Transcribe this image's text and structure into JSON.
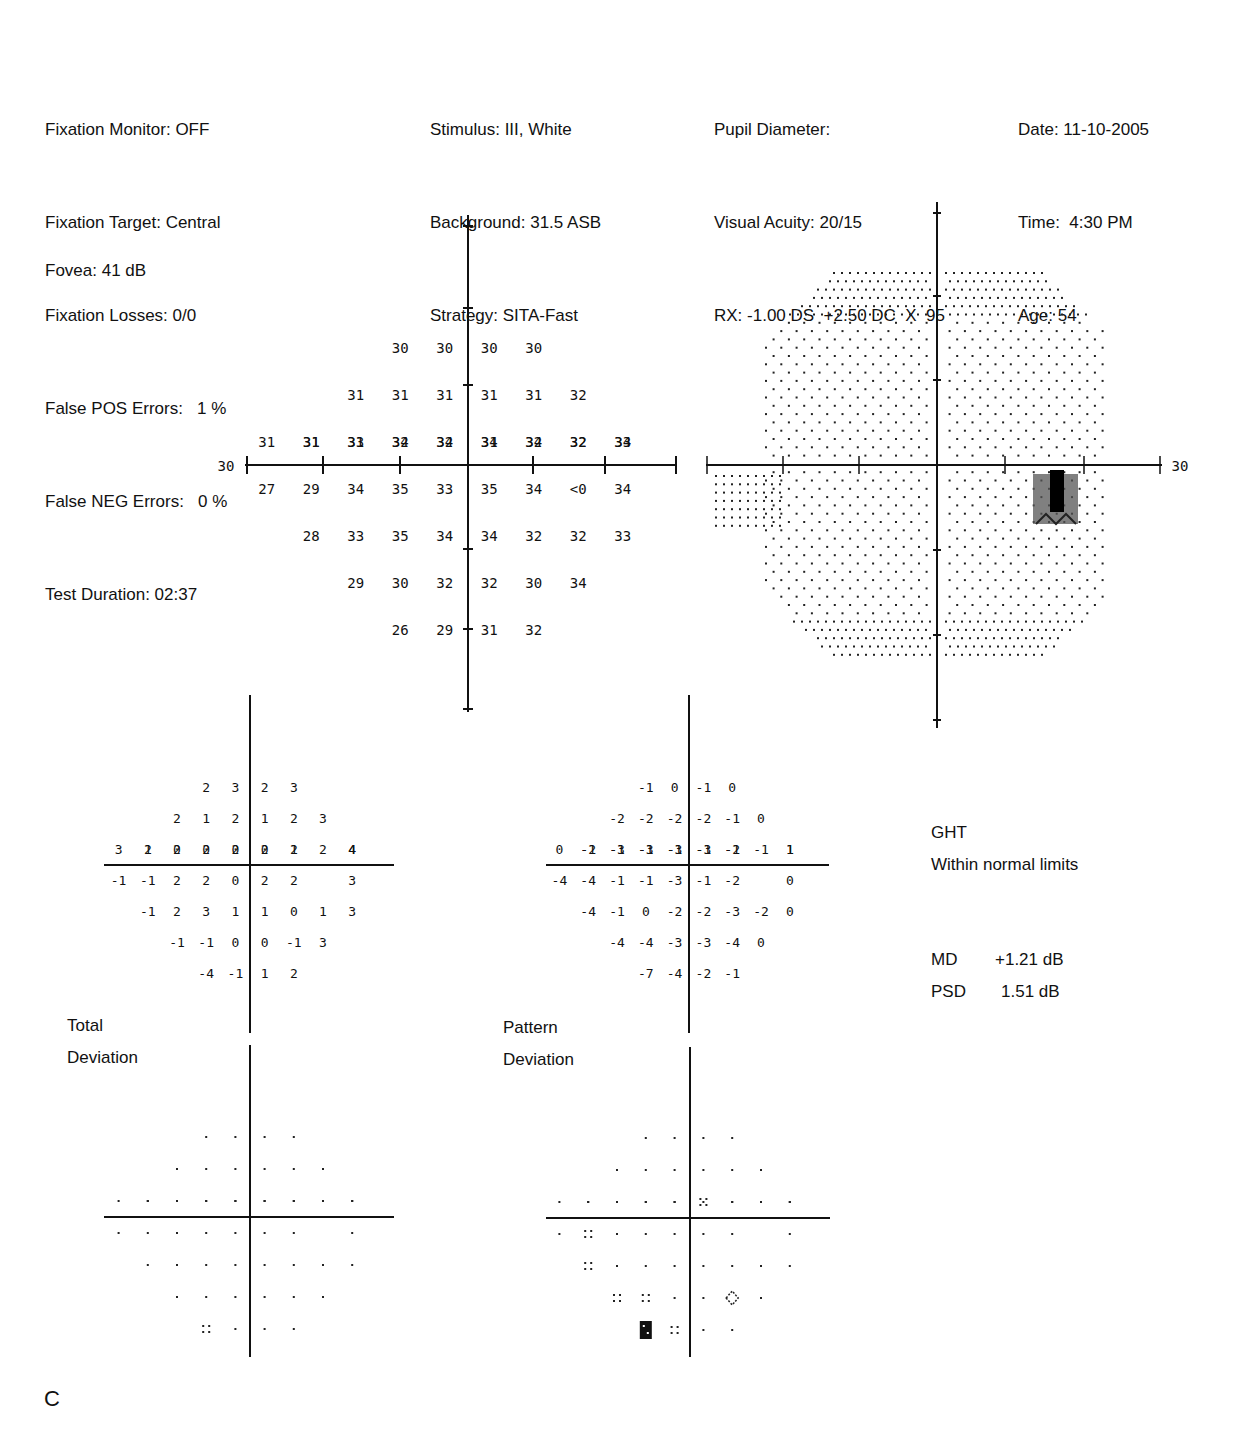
{
  "header": {
    "left": [
      "Fixation Monitor: OFF",
      "Fixation Target: Central",
      "Fixation Losses: 0/0",
      "False POS Errors:   1 %",
      "False NEG Errors:   0 %",
      "Test Duration: 02:37"
    ],
    "fovea": "Fovea: 41 dB",
    "stimulus": [
      "Stimulus: III, White",
      "Background: 31.5 ASB",
      "Strategy: SITA-Fast"
    ],
    "patient": [
      "Pupil Diameter:",
      "Visual Acuity: 20/15",
      "RX: -1.00 DS  +2.50 DC  X  95"
    ],
    "session": [
      "Date: 11-10-2005",
      "Time:  4:30 PM",
      "Age: 54"
    ]
  },
  "threshold_plot": {
    "axis_label_left": "30",
    "axis_label_right": "30",
    "rows": [
      {
        "y": 3,
        "cells": [
          [
            -2,
            "30"
          ],
          [
            -1,
            "30"
          ],
          [
            1,
            "30"
          ],
          [
            2,
            "30"
          ]
        ]
      },
      {
        "y": 2,
        "cells": [
          [
            -3,
            "31"
          ],
          [
            -2,
            "31"
          ],
          [
            -1,
            "31"
          ],
          [
            1,
            "31"
          ],
          [
            2,
            "31"
          ],
          [
            3,
            "32"
          ]
        ]
      },
      {
        "y": 1,
        "cells": [
          [
            -4,
            "31"
          ],
          [
            -3,
            "31"
          ],
          [
            -2,
            "32"
          ],
          [
            -1,
            "32"
          ],
          [
            1,
            "31"
          ],
          [
            2,
            "32"
          ],
          [
            3,
            "32"
          ],
          [
            4,
            "33"
          ]
        ]
      },
      {
        "y": 0,
        "cells": [
          [
            -5,
            "31"
          ],
          [
            -4,
            "31"
          ],
          [
            -3,
            "33"
          ],
          [
            -2,
            "34"
          ],
          [
            -1,
            "34"
          ],
          [
            1,
            "34"
          ],
          [
            2,
            "34"
          ],
          [
            3,
            "32"
          ],
          [
            4,
            "34"
          ]
        ]
      },
      {
        "y": -1,
        "cells": [
          [
            -5,
            "27"
          ],
          [
            -4,
            "29"
          ],
          [
            -3,
            "34"
          ],
          [
            -2,
            "35"
          ],
          [
            -1,
            "33"
          ],
          [
            1,
            "35"
          ],
          [
            2,
            "34"
          ],
          [
            3,
            "<0"
          ],
          [
            4,
            "34"
          ]
        ]
      },
      {
        "y": -2,
        "cells": [
          [
            -4,
            "28"
          ],
          [
            -3,
            "33"
          ],
          [
            -2,
            "35"
          ],
          [
            -1,
            "34"
          ],
          [
            1,
            "34"
          ],
          [
            2,
            "32"
          ],
          [
            3,
            "32"
          ],
          [
            4,
            "33"
          ]
        ]
      },
      {
        "y": -3,
        "cells": [
          [
            -3,
            "29"
          ],
          [
            -2,
            "30"
          ],
          [
            -1,
            "32"
          ],
          [
            1,
            "32"
          ],
          [
            2,
            "30"
          ],
          [
            3,
            "34"
          ]
        ]
      },
      {
        "y": -4,
        "cells": [
          [
            -2,
            "26"
          ],
          [
            -1,
            "29"
          ],
          [
            1,
            "31"
          ],
          [
            2,
            "32"
          ]
        ]
      }
    ]
  },
  "grayscale_plot": {
    "axis_label_right": "30",
    "blind_spot_note": "dark region inferotemporal (right of center, just below horizontal meridian)"
  },
  "total_deviation": {
    "label_line1": "Total",
    "label_line2": "Deviation",
    "rows": [
      {
        "y": 3,
        "cells": [
          [
            -2,
            "2"
          ],
          [
            -1,
            "3"
          ],
          [
            1,
            "2"
          ],
          [
            2,
            "3"
          ]
        ]
      },
      {
        "y": 2,
        "cells": [
          [
            -3,
            "2"
          ],
          [
            -2,
            "1"
          ],
          [
            -1,
            "2"
          ],
          [
            1,
            "1"
          ],
          [
            2,
            "2"
          ],
          [
            3,
            "3"
          ]
        ]
      },
      {
        "y": 1,
        "cells": [
          [
            -4,
            "2"
          ],
          [
            -3,
            "0"
          ],
          [
            -2,
            "0"
          ],
          [
            -1,
            "0"
          ],
          [
            1,
            "0"
          ],
          [
            2,
            "1"
          ],
          [
            3,
            "2"
          ],
          [
            4,
            "4"
          ]
        ]
      },
      {
        "y": 0,
        "cells": [
          [
            -5,
            "3"
          ],
          [
            -4,
            "1"
          ],
          [
            -3,
            "2"
          ],
          [
            -2,
            "2"
          ],
          [
            -1,
            "2"
          ],
          [
            1,
            "2"
          ],
          [
            2,
            "2"
          ],
          [
            4,
            "4"
          ]
        ]
      },
      {
        "y": -1,
        "cells": [
          [
            -5,
            "-1"
          ],
          [
            -4,
            "-1"
          ],
          [
            -3,
            "2"
          ],
          [
            -2,
            "2"
          ],
          [
            -1,
            "0"
          ],
          [
            1,
            "2"
          ],
          [
            2,
            "2"
          ],
          [
            4,
            "3"
          ]
        ]
      },
      {
        "y": -2,
        "cells": [
          [
            -4,
            "-1"
          ],
          [
            -3,
            "2"
          ],
          [
            -2,
            "3"
          ],
          [
            -1,
            "1"
          ],
          [
            1,
            "1"
          ],
          [
            2,
            "0"
          ],
          [
            3,
            "1"
          ],
          [
            4,
            "3"
          ]
        ]
      },
      {
        "y": -3,
        "cells": [
          [
            -3,
            "-1"
          ],
          [
            -2,
            "-1"
          ],
          [
            -1,
            "0"
          ],
          [
            1,
            "0"
          ],
          [
            2,
            "-1"
          ],
          [
            3,
            "3"
          ]
        ]
      },
      {
        "y": -4,
        "cells": [
          [
            -2,
            "-4"
          ],
          [
            -1,
            "-1"
          ],
          [
            1,
            "1"
          ],
          [
            2,
            "2"
          ]
        ]
      }
    ],
    "prob_symbols": [
      {
        "y": 3,
        "cells": [
          [
            -2,
            "dot"
          ],
          [
            -1,
            "dot"
          ],
          [
            1,
            "dot"
          ],
          [
            2,
            "dot"
          ]
        ]
      },
      {
        "y": 2,
        "cells": [
          [
            -3,
            "dot"
          ],
          [
            -2,
            "dot"
          ],
          [
            -1,
            "dot"
          ],
          [
            1,
            "dot"
          ],
          [
            2,
            "dot"
          ],
          [
            3,
            "dot"
          ]
        ]
      },
      {
        "y": 1,
        "cells": [
          [
            -4,
            "dot"
          ],
          [
            -3,
            "dot"
          ],
          [
            -2,
            "dot"
          ],
          [
            -1,
            "dot"
          ],
          [
            1,
            "dot"
          ],
          [
            2,
            "dot"
          ],
          [
            3,
            "dot"
          ],
          [
            4,
            "dot"
          ]
        ]
      },
      {
        "y": 0,
        "cells": [
          [
            -5,
            "dot"
          ],
          [
            -4,
            "dot"
          ],
          [
            -3,
            "dot"
          ],
          [
            -2,
            "dot"
          ],
          [
            -1,
            "dot"
          ],
          [
            1,
            "dot"
          ],
          [
            2,
            "dot"
          ],
          [
            4,
            "dot"
          ]
        ]
      },
      {
        "y": -1,
        "cells": [
          [
            -5,
            "dot"
          ],
          [
            -4,
            "dot"
          ],
          [
            -3,
            "dot"
          ],
          [
            -2,
            "dot"
          ],
          [
            -1,
            "dot"
          ],
          [
            1,
            "dot"
          ],
          [
            2,
            "dot"
          ],
          [
            4,
            "dot"
          ]
        ]
      },
      {
        "y": -2,
        "cells": [
          [
            -4,
            "dot"
          ],
          [
            -3,
            "dot"
          ],
          [
            -2,
            "dot"
          ],
          [
            -1,
            "dot"
          ],
          [
            1,
            "dot"
          ],
          [
            2,
            "dot"
          ],
          [
            3,
            "dot"
          ],
          [
            4,
            "dot"
          ]
        ]
      },
      {
        "y": -3,
        "cells": [
          [
            -3,
            "dot"
          ],
          [
            -2,
            "dot"
          ],
          [
            -1,
            "dot"
          ],
          [
            1,
            "dot"
          ],
          [
            2,
            "dot"
          ],
          [
            3,
            "dot"
          ]
        ]
      },
      {
        "y": -4,
        "cells": [
          [
            -2,
            "p5"
          ],
          [
            -1,
            "dot"
          ],
          [
            1,
            "dot"
          ],
          [
            2,
            "dot"
          ]
        ]
      }
    ]
  },
  "pattern_deviation": {
    "label_line1": "Pattern",
    "label_line2": "Deviation",
    "rows": [
      {
        "y": 3,
        "cells": [
          [
            -2,
            "-1"
          ],
          [
            -1,
            "0"
          ],
          [
            1,
            "-1"
          ],
          [
            2,
            "0"
          ]
        ]
      },
      {
        "y": 2,
        "cells": [
          [
            -3,
            "-2"
          ],
          [
            -2,
            "-2"
          ],
          [
            -1,
            "-2"
          ],
          [
            1,
            "-2"
          ],
          [
            2,
            "-1"
          ],
          [
            3,
            "0"
          ]
        ]
      },
      {
        "y": 1,
        "cells": [
          [
            -4,
            "-1"
          ],
          [
            -3,
            "-3"
          ],
          [
            -2,
            "-3"
          ],
          [
            -1,
            "-3"
          ],
          [
            1,
            "-3"
          ],
          [
            2,
            "-2"
          ],
          [
            3,
            "-1"
          ],
          [
            4,
            "1"
          ]
        ]
      },
      {
        "y": 0,
        "cells": [
          [
            -5,
            "0"
          ],
          [
            -4,
            "-2"
          ],
          [
            -3,
            "-1"
          ],
          [
            -2,
            "-1"
          ],
          [
            -1,
            "-1"
          ],
          [
            1,
            "-1"
          ],
          [
            2,
            "-1"
          ],
          [
            4,
            "1"
          ]
        ]
      },
      {
        "y": -1,
        "cells": [
          [
            -5,
            "-4"
          ],
          [
            -4,
            "-4"
          ],
          [
            -3,
            "-1"
          ],
          [
            -2,
            "-1"
          ],
          [
            -1,
            "-3"
          ],
          [
            1,
            "-1"
          ],
          [
            2,
            "-2"
          ],
          [
            4,
            "0"
          ]
        ]
      },
      {
        "y": -2,
        "cells": [
          [
            -4,
            "-4"
          ],
          [
            -3,
            "-1"
          ],
          [
            -2,
            "0"
          ],
          [
            -1,
            "-2"
          ],
          [
            1,
            "-2"
          ],
          [
            2,
            "-3"
          ],
          [
            3,
            "-2"
          ],
          [
            4,
            "0"
          ]
        ]
      },
      {
        "y": -3,
        "cells": [
          [
            -3,
            "-4"
          ],
          [
            -2,
            "-4"
          ],
          [
            -1,
            "-3"
          ],
          [
            1,
            "-3"
          ],
          [
            2,
            "-4"
          ],
          [
            3,
            "0"
          ]
        ]
      },
      {
        "y": -4,
        "cells": [
          [
            -2,
            "-7"
          ],
          [
            -1,
            "-4"
          ],
          [
            1,
            "-2"
          ],
          [
            2,
            "-1"
          ]
        ]
      }
    ],
    "prob_symbols": [
      {
        "y": 3,
        "cells": [
          [
            -2,
            "dot"
          ],
          [
            -1,
            "dot"
          ],
          [
            1,
            "dot"
          ],
          [
            2,
            "dot"
          ]
        ]
      },
      {
        "y": 2,
        "cells": [
          [
            -3,
            "dot"
          ],
          [
            -2,
            "dot"
          ],
          [
            -1,
            "dot"
          ],
          [
            1,
            "dot"
          ],
          [
            2,
            "dot"
          ],
          [
            3,
            "dot"
          ]
        ]
      },
      {
        "y": 1,
        "cells": [
          [
            -4,
            "dot"
          ],
          [
            -3,
            "dot"
          ],
          [
            -2,
            "dot"
          ],
          [
            -1,
            "dot"
          ],
          [
            1,
            "p5"
          ],
          [
            2,
            "dot"
          ],
          [
            3,
            "dot"
          ],
          [
            4,
            "dot"
          ]
        ]
      },
      {
        "y": 0,
        "cells": [
          [
            -5,
            "dot"
          ],
          [
            -4,
            "dot"
          ],
          [
            -3,
            "dot"
          ],
          [
            -2,
            "dot"
          ],
          [
            -1,
            "dot"
          ],
          [
            1,
            "dot"
          ],
          [
            2,
            "dot"
          ],
          [
            4,
            "dot"
          ]
        ]
      },
      {
        "y": -1,
        "cells": [
          [
            -5,
            "dot"
          ],
          [
            -4,
            "p5"
          ],
          [
            -3,
            "dot"
          ],
          [
            -2,
            "dot"
          ],
          [
            -1,
            "dot"
          ],
          [
            1,
            "dot"
          ],
          [
            2,
            "dot"
          ],
          [
            4,
            "dot"
          ]
        ]
      },
      {
        "y": -2,
        "cells": [
          [
            -4,
            "p5"
          ],
          [
            -3,
            "dot"
          ],
          [
            -2,
            "dot"
          ],
          [
            -1,
            "dot"
          ],
          [
            1,
            "dot"
          ],
          [
            2,
            "dot"
          ],
          [
            3,
            "dot"
          ],
          [
            4,
            "dot"
          ]
        ]
      },
      {
        "y": -3,
        "cells": [
          [
            -3,
            "p5"
          ],
          [
            -2,
            "p5"
          ],
          [
            -1,
            "dot"
          ],
          [
            1,
            "dot"
          ],
          [
            2,
            "p2"
          ],
          [
            3,
            "dot"
          ]
        ]
      },
      {
        "y": -4,
        "cells": [
          [
            -2,
            "p05"
          ],
          [
            -1,
            "p5"
          ],
          [
            1,
            "dot"
          ],
          [
            2,
            "dot"
          ]
        ]
      }
    ]
  },
  "ght": {
    "label": "GHT",
    "result": "Within normal limits"
  },
  "indices": {
    "md_label": "MD",
    "md_value": "+1.21 dB",
    "psd_label": "PSD",
    "psd_value": "1.51 dB"
  },
  "figure_letter": "C"
}
